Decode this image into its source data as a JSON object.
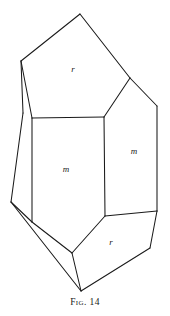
{
  "figure": {
    "caption": "Fig. 14",
    "title": "Fig. 14",
    "background_color": "#ffffff",
    "line_color": "#1a1a1a",
    "label_color": "#1a1a1a",
    "labels": [
      {
        "text": "r",
        "x": 73,
        "y": 70,
        "name": "face-label-r-top"
      },
      {
        "text": "m",
        "x": 66,
        "y": 170,
        "name": "face-label-m-left"
      },
      {
        "text": "m",
        "x": 134,
        "y": 152,
        "name": "face-label-m-right"
      },
      {
        "text": "r",
        "x": 111,
        "y": 243,
        "name": "face-label-r-bottom"
      }
    ],
    "edges": [
      {
        "name": "edge-apex-to-left-shoulder",
        "x1": 80,
        "y1": 14,
        "x2": 21,
        "y2": 61
      },
      {
        "name": "edge-apex-to-right-shoulder",
        "x1": 80,
        "y1": 14,
        "x2": 130,
        "y2": 78
      },
      {
        "name": "edge-left-shoulder-to-face-top-left",
        "x1": 21,
        "y1": 61,
        "x2": 32,
        "y2": 118
      },
      {
        "name": "edge-left-shoulder-down-outer",
        "x1": 21,
        "y1": 61,
        "x2": 23,
        "y2": 113
      },
      {
        "name": "edge-outer-left-vertical",
        "x1": 23,
        "y1": 113,
        "x2": 11,
        "y2": 202
      },
      {
        "name": "edge-front-face-top",
        "x1": 32,
        "y1": 118,
        "x2": 104,
        "y2": 117
      },
      {
        "name": "edge-face-top-left-to-bottom-left",
        "x1": 32,
        "y1": 118,
        "x2": 32,
        "y2": 222
      },
      {
        "name": "edge-front-face-center-vertical",
        "x1": 104,
        "y1": 117,
        "x2": 105,
        "y2": 216
      },
      {
        "name": "edge-right-shoulder-to-face-top",
        "x1": 130,
        "y1": 78,
        "x2": 104,
        "y2": 117
      },
      {
        "name": "edge-right-shoulder-to-right-edge",
        "x1": 130,
        "y1": 78,
        "x2": 157,
        "y2": 106
      },
      {
        "name": "edge-right-outer-vertical",
        "x1": 157,
        "y1": 106,
        "x2": 157,
        "y2": 211
      },
      {
        "name": "edge-right-face-bottom",
        "x1": 105,
        "y1": 216,
        "x2": 157,
        "y2": 211
      },
      {
        "name": "edge-right-bottom-bevel",
        "x1": 157,
        "y1": 211,
        "x2": 150,
        "y2": 248
      },
      {
        "name": "edge-bottom-right-to-apex",
        "x1": 150,
        "y1": 248,
        "x2": 81,
        "y2": 291
      },
      {
        "name": "edge-front-face-bottom",
        "x1": 32,
        "y1": 222,
        "x2": 72,
        "y2": 253
      },
      {
        "name": "edge-front-bottom-to-right-face",
        "x1": 72,
        "y1": 253,
        "x2": 105,
        "y2": 216
      },
      {
        "name": "edge-front-bottom-to-apex",
        "x1": 72,
        "y1": 253,
        "x2": 81,
        "y2": 291
      },
      {
        "name": "edge-left-bottom-to-front-bottom",
        "x1": 11,
        "y1": 202,
        "x2": 32,
        "y2": 222
      },
      {
        "name": "edge-left-bottom-to-apex",
        "x1": 11,
        "y1": 202,
        "x2": 81,
        "y2": 291
      }
    ]
  }
}
